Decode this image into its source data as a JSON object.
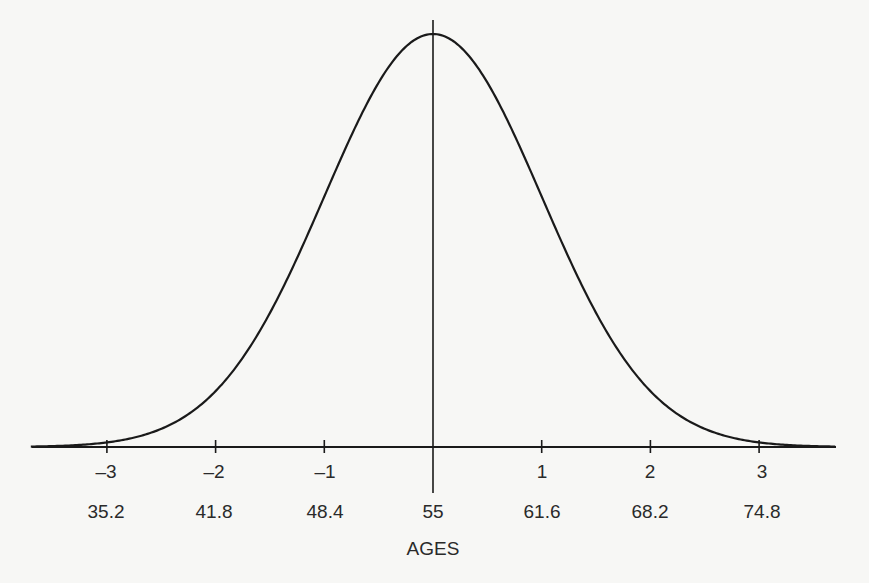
{
  "chart_data": {
    "type": "line",
    "title": "",
    "distribution": {
      "mean": 55,
      "std_dev": 6.6
    },
    "xlabel": "AGES",
    "ylabel": "",
    "z_ticks": [
      "–3",
      "–2",
      "–1",
      "",
      "1",
      "2",
      "3"
    ],
    "age_ticks": [
      "35.2",
      "41.8",
      "48.4",
      "55",
      "61.6",
      "68.2",
      "74.8"
    ],
    "z_values": [
      -3,
      -2,
      -1,
      0,
      1,
      2,
      3
    ],
    "age_values": [
      35.2,
      41.8,
      48.4,
      55,
      61.6,
      68.2,
      74.8
    ],
    "xlim_z": [
      -3.7,
      3.7
    ],
    "grid": false,
    "legend": null,
    "colors": {
      "curve": "#1a1a1a",
      "axis": "#1a1a1a",
      "background": "#f7f7f5"
    }
  }
}
